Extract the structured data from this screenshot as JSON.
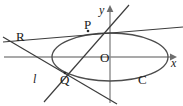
{
  "figure": {
    "kind": "geometry-diagram",
    "width": 183,
    "height": 106,
    "background_color": "#ffffff",
    "curve_color": "#4d4d4d",
    "line_color": "#3c3c3c",
    "axis_color": "#8c8c8c",
    "label_color": "#1a1a1a"
  },
  "labels": {
    "point_R": "R",
    "point_P": "P",
    "point_Q": "Q",
    "origin_O": "O",
    "axis_y": "y",
    "axis_x": "x",
    "line_l": "l",
    "curve_C": "C"
  },
  "geometry": {
    "ellipse": {
      "name": "C",
      "center": {
        "x": 110,
        "y": 57
      },
      "semi_major_x": 58,
      "semi_minor_y": 24
    },
    "axes": {
      "x_axis": {
        "y": 57,
        "x_start": 4,
        "x_end": 176,
        "arrow": "right"
      },
      "y_axis": {
        "x": 110,
        "y_start": 7,
        "y_end": 103,
        "arrow": "up"
      }
    },
    "points": [
      {
        "name": "P",
        "x": 88,
        "y": 31,
        "on": "ellipse"
      },
      {
        "name": "Q",
        "x": 65,
        "y": 73,
        "on": "ellipse"
      },
      {
        "name": "R",
        "x": 25,
        "y": 38,
        "on": "external"
      },
      {
        "name": "O",
        "x": 110,
        "y": 57,
        "on": "origin"
      }
    ],
    "lines": [
      {
        "name": "l",
        "through": [
          "P",
          "Q"
        ],
        "from": {
          "x": 129,
          "y": 5
        },
        "to": {
          "x": 44,
          "y": 102
        }
      },
      {
        "name": "RP",
        "through": [
          "R",
          "P"
        ],
        "from": {
          "x": 3,
          "y": 42
        },
        "to": {
          "x": 183,
          "y": 27
        }
      },
      {
        "name": "RQ",
        "through": [
          "R",
          "Q"
        ],
        "from": {
          "x": 3,
          "y": 37
        },
        "to": {
          "x": 117,
          "y": 104
        }
      }
    ]
  }
}
